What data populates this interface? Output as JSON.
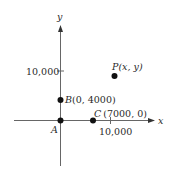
{
  "diagram": {
    "type": "coordinate-plane",
    "axes": {
      "x_label": "x",
      "y_label": "y",
      "x_tick_label": "10,000",
      "y_tick_label": "10,000",
      "color": "#555555"
    },
    "points": [
      {
        "id": "A",
        "label": "A",
        "coords": "",
        "x": 0,
        "y": 0
      },
      {
        "id": "B",
        "label": "B",
        "coords": "(0, 4000)",
        "x": 0,
        "y": 4000
      },
      {
        "id": "C",
        "label": "C",
        "coords": "(7000, 0)",
        "x": 7000,
        "y": 0
      },
      {
        "id": "P",
        "label": "P",
        "coords": "(x, y)"
      }
    ],
    "point_color": "#111111"
  }
}
